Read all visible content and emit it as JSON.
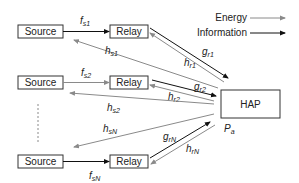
{
  "legend": {
    "energy_label": "Energy",
    "information_label": "Information",
    "energy_color": "#8a8a8a",
    "information_color": "#111111"
  },
  "nodes": {
    "source_label": "Source",
    "relay_label": "Relay",
    "hap_label": "HAP"
  },
  "links": {
    "fs1": {
      "main": "f",
      "sub": "s1"
    },
    "fs2": {
      "main": "f",
      "sub": "s2"
    },
    "fsN": {
      "main": "f",
      "sub": "sN"
    },
    "hs1": {
      "main": "h",
      "sub": "s1"
    },
    "hs2": {
      "main": "h",
      "sub": "s2"
    },
    "hsN": {
      "main": "h",
      "sub": "sN"
    },
    "gr1": {
      "main": "g",
      "sub": "r1"
    },
    "gr2": {
      "main": "g",
      "sub": "r2"
    },
    "grN": {
      "main": "g",
      "sub": "rN"
    },
    "hr1": {
      "main": "h",
      "sub": "r1"
    },
    "hr2": {
      "main": "h",
      "sub": "r2"
    },
    "hrN": {
      "main": "h",
      "sub": "rN"
    }
  },
  "hap_power": {
    "main": "P",
    "sub": "a"
  }
}
